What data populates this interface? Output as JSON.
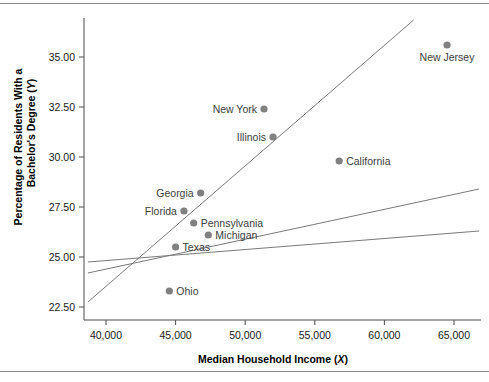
{
  "chart_data": {
    "type": "scatter",
    "title": "",
    "xlabel": "Median Household Income (X)",
    "ylabel": "Percentage of Residents With a Bachelor's Degree (Y)",
    "xlabel_main": "Median Household Income (",
    "xlabel_var": "X",
    "xlabel_end": ")",
    "ylabel_line1": "Percentage of Residents With a",
    "ylabel_line2_main": "Bachelor's Degree (",
    "ylabel_line2_var": "Y",
    "ylabel_line2_end": ")",
    "xlim": [
      38700,
      467000
    ],
    "ylim": [
      21.5,
      36.6
    ],
    "xticks": [
      40000,
      45000,
      50000,
      55000,
      60000,
      65000
    ],
    "xtick_labels": [
      "40,000",
      "45,000",
      "50,000",
      "55,000",
      "60,000",
      "65,000"
    ],
    "yticks": [
      22.5,
      25.0,
      27.5,
      30.0,
      32.5,
      35.0
    ],
    "ytick_labels": [
      "22.50",
      "25.00",
      "27.50",
      "30.00",
      "32.50",
      "35.00"
    ],
    "grid": false,
    "legend": "none",
    "marker_color": "#808080",
    "line_color": "#7a7a7a",
    "axis_color": "#4d4d4d",
    "points": [
      {
        "name": "New Jersey",
        "x": 64500,
        "y": 35.6,
        "label_pos": "below"
      },
      {
        "name": "New York",
        "x": 51350,
        "y": 32.4,
        "label_pos": "left"
      },
      {
        "name": "Illinois",
        "x": 52000,
        "y": 31.0,
        "label_pos": "left"
      },
      {
        "name": "California",
        "x": 56750,
        "y": 29.8,
        "label_pos": "right"
      },
      {
        "name": "Georgia",
        "x": 46800,
        "y": 28.2,
        "label_pos": "left"
      },
      {
        "name": "Florida",
        "x": 45600,
        "y": 27.3,
        "label_pos": "left"
      },
      {
        "name": "Pennsylvania",
        "x": 46300,
        "y": 26.7,
        "label_pos": "right"
      },
      {
        "name": "Michigan",
        "x": 47350,
        "y": 26.1,
        "label_pos": "right"
      },
      {
        "name": "Texas",
        "x": 45000,
        "y": 25.5,
        "label_pos": "right"
      },
      {
        "name": "Ohio",
        "x": 44550,
        "y": 23.3,
        "label_pos": "right"
      }
    ],
    "lines": [
      {
        "name": "steep-line",
        "x1": 38700,
        "y1": 22.75,
        "x2": 62100,
        "y2": 36.85
      },
      {
        "name": "medium-line",
        "x1": 38700,
        "y1": 24.2,
        "x2": 66800,
        "y2": 28.4
      },
      {
        "name": "flat-line",
        "x1": 38700,
        "y1": 24.75,
        "x2": 66800,
        "y2": 26.3
      }
    ]
  }
}
